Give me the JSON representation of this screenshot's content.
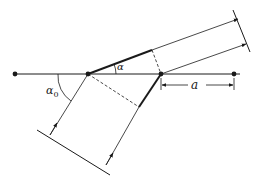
{
  "diagram": {
    "type": "diffraction-geometry",
    "labels": {
      "incident_angle": "α",
      "incident_angle_sub": "0",
      "exit_angle": "α",
      "spacing": "a"
    },
    "colors": {
      "line": "#1a1a1a",
      "background": "#ffffff"
    },
    "points": {
      "far_left": [
        15,
        74
      ],
      "atom_a": [
        88,
        74
      ],
      "atom_b": [
        161,
        74
      ],
      "far_right": [
        234,
        74
      ]
    }
  }
}
